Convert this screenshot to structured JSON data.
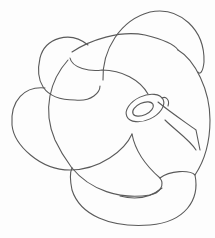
{
  "image": {
    "description": "Pencil line drawing of an interlaced knot-like form with looping bands and a ring in the center-right",
    "stroke_color": "#555555",
    "background_color": "#fdfdfd"
  }
}
